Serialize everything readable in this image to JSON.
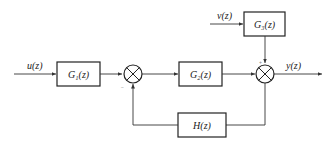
{
  "diagram": {
    "type": "block-diagram",
    "signals": {
      "input": "u(z)",
      "disturbance": "v(z)",
      "output": "y(z)"
    },
    "blocks": {
      "g1": "G₁(z)",
      "g2": "G₂(z)",
      "g3": "G₃(z)",
      "h": "H(z)"
    },
    "junctions": {
      "sum1_feedback_sign": "−",
      "sum2_disturbance_sign": "+"
    },
    "colors": {
      "line": "#333333",
      "background": "#ffffff"
    }
  }
}
